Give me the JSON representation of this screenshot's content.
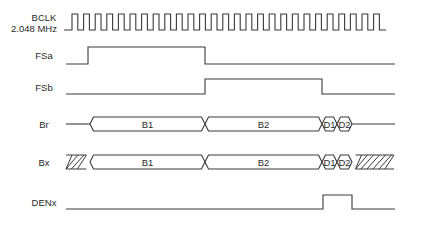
{
  "diagram": {
    "title": "",
    "colors": {
      "line": "#3a3a3a",
      "text": "#2a2a2a",
      "background": "#ffffff"
    },
    "signals": [
      {
        "id": "bclk",
        "label_lines": [
          "BCLK",
          "2.048 MHz"
        ],
        "type": "clock",
        "x_start": 64,
        "x_first_edge": 72,
        "period": 11.6,
        "pulses": 27,
        "x_end": 386,
        "y_high": 14,
        "y_low": 30
      },
      {
        "id": "fsa",
        "label_lines": [
          "FSa"
        ],
        "type": "digital",
        "x_start": 66,
        "x_end": 395,
        "y_high": 47,
        "y_low": 64,
        "initial": "low",
        "edges": [
          88,
          205
        ]
      },
      {
        "id": "fsb",
        "label_lines": [
          "FSb"
        ],
        "type": "digital",
        "x_start": 66,
        "x_end": 395,
        "y_high": 79,
        "y_low": 94,
        "initial": "low",
        "edges": [
          205,
          322
        ]
      },
      {
        "id": "br",
        "label_lines": [
          "Br"
        ],
        "type": "bus",
        "x_start": 66,
        "x_end": 395,
        "y_top": 117,
        "y_bottom": 131,
        "segments": [
          {
            "kind": "idle",
            "x0": 66,
            "x1": 90
          },
          {
            "kind": "data",
            "label": "B1",
            "x0": 90,
            "x1": 205
          },
          {
            "kind": "data",
            "label": "B2",
            "x0": 205,
            "x1": 322
          },
          {
            "kind": "data",
            "label": "D1",
            "x0": 322,
            "x1": 337
          },
          {
            "kind": "data",
            "label": "D2",
            "x0": 337,
            "x1": 352
          },
          {
            "kind": "idle",
            "x0": 352,
            "x1": 395
          }
        ]
      },
      {
        "id": "bx",
        "label_lines": [
          "Bx"
        ],
        "type": "bus",
        "x_start": 66,
        "x_end": 395,
        "y_top": 155,
        "y_bottom": 169,
        "segments": [
          {
            "kind": "hatch",
            "x0": 66,
            "x1": 90
          },
          {
            "kind": "data",
            "label": "B1",
            "x0": 90,
            "x1": 205
          },
          {
            "kind": "data",
            "label": "B2",
            "x0": 205,
            "x1": 322
          },
          {
            "kind": "data",
            "label": "D1",
            "x0": 322,
            "x1": 337
          },
          {
            "kind": "data",
            "label": "D2",
            "x0": 337,
            "x1": 352
          },
          {
            "kind": "hatch",
            "x0": 352,
            "x1": 394
          }
        ]
      },
      {
        "id": "denx",
        "label_lines": [
          "DENx"
        ],
        "type": "digital",
        "x_start": 66,
        "x_end": 395,
        "y_high": 195,
        "y_low": 209,
        "initial": "low",
        "edges": [
          323,
          352
        ]
      }
    ],
    "label_layout": {
      "bclk": {
        "x": 44,
        "y": [
          21,
          32
        ]
      },
      "fsa": {
        "x": 44,
        "y": [
          58
        ]
      },
      "fsb": {
        "x": 44,
        "y": [
          90
        ]
      },
      "br": {
        "x": 44,
        "y": [
          128
        ]
      },
      "bx": {
        "x": 44,
        "y": [
          166
        ]
      },
      "denx": {
        "x": 44,
        "y": [
          206
        ]
      }
    }
  }
}
